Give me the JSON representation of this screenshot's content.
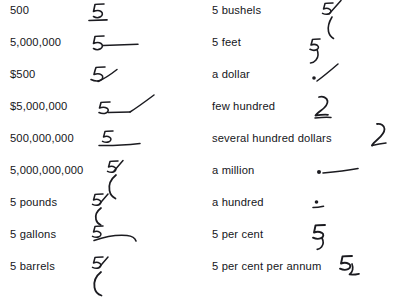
{
  "page": {
    "kind": "shorthand-numerals-table",
    "background_color": "#ffffff",
    "ink_color": "#1b1b20",
    "text_color": "#15161a",
    "columns": 2,
    "rows_per_column": 9
  },
  "left_column": {
    "entries": [
      {
        "label": "500",
        "outline_name": "five-underscored",
        "outline_desc": "figure 5 with short underline beneath"
      },
      {
        "label": "5,000,000",
        "outline_name": "five-with-long-dash",
        "outline_desc": "figure 5 followed by long horizontal dash"
      },
      {
        "label": "$500",
        "outline_name": "five-with-upstroke",
        "outline_desc": "figure 5 with rising oblique stroke"
      },
      {
        "label": "$5,000,000",
        "outline_name": "five-dash-upstroke",
        "outline_desc": "figure 5, horizontal dash, then rising oblique stroke"
      },
      {
        "label": "500,000,000",
        "outline_name": "five-over-long-underline",
        "outline_desc": "figure 5 above a long horizontal underline"
      },
      {
        "label": "5,000,000,000",
        "outline_name": "five-with-deep-descender",
        "outline_desc": "figure 5 with long descending curved stroke"
      },
      {
        "label": "5 pounds",
        "outline_name": "five-with-small-hook",
        "outline_desc": "figure 5 with small descending hook"
      },
      {
        "label": "5 gallons",
        "outline_name": "five-with-sweeping-curve",
        "outline_desc": "figure 5 with long sweeping horizontal curve"
      },
      {
        "label": "5 barrels",
        "outline_name": "five-with-large-hook",
        "outline_desc": "figure 5 with large descending hook"
      }
    ]
  },
  "right_column": {
    "entries": [
      {
        "label": "5 bushels",
        "outline_name": "five-with-long-downstroke",
        "outline_desc": "figure 5 with long descending oblique stroke"
      },
      {
        "label": "5 feet",
        "outline_name": "five-with-curved-tail",
        "outline_desc": "figure 5 with curved descending tail"
      },
      {
        "label": "a dollar",
        "outline_name": "dot-with-upstroke",
        "outline_desc": "dot followed by rising oblique stroke"
      },
      {
        "label": "few hundred",
        "outline_name": "curved-two-stroke",
        "outline_desc": "curved stroke resembling figure 2"
      },
      {
        "label": "several hundred dollars",
        "outline_name": "curved-three-stroke",
        "outline_desc": "curved stroke resembling figure 3 with tail"
      },
      {
        "label": "a million",
        "outline_name": "dot-with-long-dash",
        "outline_desc": "dot followed by long horizontal dash"
      },
      {
        "label": "a hundred",
        "outline_name": "dot-over-short-dash",
        "outline_desc": "dot above a short horizontal dash"
      },
      {
        "label": "5 per cent",
        "outline_name": "five-with-short-tail",
        "outline_desc": "figure 5 with short curled tail"
      },
      {
        "label": "5 per cent per annum",
        "outline_name": "five-with-subscript-stroke",
        "outline_desc": "figure 5 with trailing subscript angle stroke"
      }
    ]
  }
}
